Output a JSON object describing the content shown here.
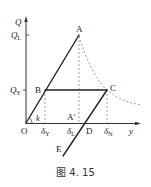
{
  "figure": {
    "caption": "图 4. 15",
    "axes": {
      "y_axis_label": "Q",
      "x_axis_label": "y",
      "origin_label": "O",
      "y_ticks": [
        "Q_L",
        "Q_Y"
      ],
      "x_ticks": [
        "δ_Y",
        "δ_L",
        "δ_N"
      ]
    },
    "points": {
      "A": "A",
      "A_prime": "A′",
      "B": "B",
      "C": "C",
      "D": "D",
      "E": "E"
    },
    "slope_label": "k",
    "labels": {
      "Q": "Q",
      "QL_main": "Q",
      "QL_sub": "L",
      "QY_main": "Q",
      "QY_sub": "Y",
      "dY_main": "δ",
      "dY_sub": "Y",
      "dL_main": "δ",
      "dL_sub": "L",
      "dN_main": "δ",
      "dN_sub": "N",
      "y": "y",
      "O": "O",
      "k": "k",
      "A": "A",
      "Ap": "A′",
      "B": "B",
      "C": "C",
      "D": "D",
      "E": "E"
    }
  }
}
